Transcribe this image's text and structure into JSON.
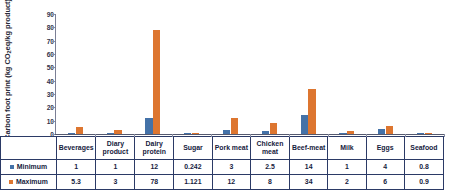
{
  "chart_data": {
    "type": "bar",
    "title": "",
    "xlabel": "",
    "ylabel": "Carbon foot print (kg CO2eq/kg product)",
    "ylim": [
      0,
      90
    ],
    "yticks": [
      0,
      10,
      20,
      30,
      40,
      50,
      60,
      70,
      80,
      90
    ],
    "grid": false,
    "legend_position": "table-row-headers",
    "categories": [
      "Beverages",
      "Diary product",
      "Dairy protein",
      "Sugar",
      "Pork meat",
      "Chicken meat",
      "Beef-meat",
      "Milk",
      "Eggs",
      "Seafood"
    ],
    "category_lines": [
      [
        "Beverages",
        ""
      ],
      [
        "Diary",
        "product"
      ],
      [
        "Dairy",
        "protein"
      ],
      [
        "Sugar",
        ""
      ],
      [
        "Pork meat",
        ""
      ],
      [
        "Chicken",
        "meat"
      ],
      [
        "Beef-meat",
        ""
      ],
      [
        "Milk",
        ""
      ],
      [
        "Eggs",
        ""
      ],
      [
        "Seafood",
        ""
      ]
    ],
    "series": [
      {
        "name": "Minimum",
        "color": "#4472a8",
        "values": [
          1,
          1,
          12,
          0.242,
          3,
          2.5,
          14,
          1,
          4,
          0.8
        ],
        "labels": [
          "1",
          "1",
          "12",
          "0.242",
          "3",
          "2.5",
          "14",
          "1",
          "4",
          "0.8"
        ]
      },
      {
        "name": "Maximum",
        "color": "#dd7630",
        "values": [
          5.3,
          3,
          78,
          1.121,
          12,
          8,
          34,
          2,
          6,
          0.9
        ],
        "labels": [
          "5.3",
          "3",
          "78",
          "1.121",
          "12",
          "8",
          "34",
          "2",
          "6",
          "0.9"
        ]
      }
    ]
  },
  "colors": {
    "minimum": "#4472a8",
    "maximum": "#dd7630",
    "axis": "#55596e",
    "table_border": "#2b3a66",
    "text": "#15213d"
  }
}
